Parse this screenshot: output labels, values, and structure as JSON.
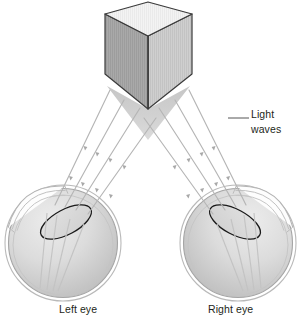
{
  "figure": {
    "type": "anatomical-diagram",
    "width": 301,
    "height": 326,
    "background_color": "#ffffff"
  },
  "labels": {
    "left_eye": "Left eye",
    "right_eye": "Right eye",
    "light_waves": "Light waves"
  },
  "object": {
    "name": "cube",
    "description": "Three-dimensional gray cube viewed from above-left",
    "top_face_color": "#f2f2f2",
    "left_face_color": "#a8a8a8",
    "right_face_color": "#c9c9c9",
    "outline_color": "#3a3a3a"
  },
  "colors": {
    "ray_stroke": "#b5b5b5",
    "cone_fill": "#c8c8c8",
    "sclera_fill": "#d8d8d8",
    "sclera_outline": "#9a9a9a",
    "lens_outline": "#1a1a1a",
    "text": "#231f20",
    "leader_line": "#555555"
  },
  "ray_count_per_eye": 4,
  "structures": [
    "cornea",
    "lens",
    "vitreous chamber",
    "retina",
    "optic disc"
  ]
}
